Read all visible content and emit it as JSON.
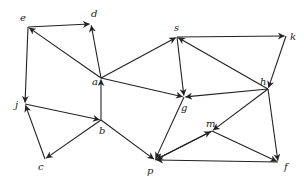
{
  "diagram": {
    "type": "directed-graph",
    "nodes": [
      {
        "id": "e",
        "label": "e",
        "x": 28,
        "y": 27,
        "lx": 20,
        "ly": 21
      },
      {
        "id": "d",
        "label": "d",
        "x": 91,
        "y": 24,
        "lx": 91,
        "ly": 17
      },
      {
        "id": "a",
        "label": "a",
        "x": 101,
        "y": 78,
        "lx": 92,
        "ly": 85
      },
      {
        "id": "s",
        "label": "s",
        "x": 177,
        "y": 37,
        "lx": 174,
        "ly": 31
      },
      {
        "id": "k",
        "label": "k",
        "x": 286,
        "y": 36,
        "lx": 290,
        "ly": 40
      },
      {
        "id": "h",
        "label": "h",
        "x": 268,
        "y": 89,
        "lx": 260,
        "ly": 85
      },
      {
        "id": "g",
        "label": "g",
        "x": 184,
        "y": 97,
        "lx": 181,
        "ly": 111
      },
      {
        "id": "j",
        "label": "j",
        "x": 25,
        "y": 104,
        "lx": 15,
        "ly": 108
      },
      {
        "id": "b",
        "label": "b",
        "x": 101,
        "y": 120,
        "lx": 99,
        "ly": 134
      },
      {
        "id": "c",
        "label": "c",
        "x": 45,
        "y": 159,
        "lx": 38,
        "ly": 170
      },
      {
        "id": "m",
        "label": "m",
        "x": 212,
        "y": 131,
        "lx": 206,
        "ly": 127
      },
      {
        "id": "p",
        "label": "p",
        "x": 155,
        "y": 160,
        "lx": 147,
        "ly": 174
      },
      {
        "id": "f",
        "label": "f",
        "x": 278,
        "y": 162,
        "lx": 284,
        "ly": 170
      }
    ],
    "edges": [
      {
        "from": "e",
        "to": "d"
      },
      {
        "from": "a",
        "to": "e"
      },
      {
        "from": "a",
        "to": "d"
      },
      {
        "from": "a",
        "to": "s"
      },
      {
        "from": "a",
        "to": "g"
      },
      {
        "from": "b",
        "to": "a"
      },
      {
        "from": "e",
        "to": "j"
      },
      {
        "from": "j",
        "to": "b"
      },
      {
        "from": "b",
        "to": "c"
      },
      {
        "from": "c",
        "to": "j"
      },
      {
        "from": "b",
        "to": "p"
      },
      {
        "from": "s",
        "to": "k"
      },
      {
        "from": "k",
        "to": "h"
      },
      {
        "from": "h",
        "to": "s"
      },
      {
        "from": "s",
        "to": "g"
      },
      {
        "from": "h",
        "to": "g"
      },
      {
        "from": "h",
        "to": "m"
      },
      {
        "from": "h",
        "to": "f"
      },
      {
        "from": "g",
        "to": "p"
      },
      {
        "from": "p",
        "to": "m"
      },
      {
        "from": "m",
        "to": "p"
      },
      {
        "from": "m",
        "to": "f"
      },
      {
        "from": "f",
        "to": "p"
      }
    ]
  }
}
